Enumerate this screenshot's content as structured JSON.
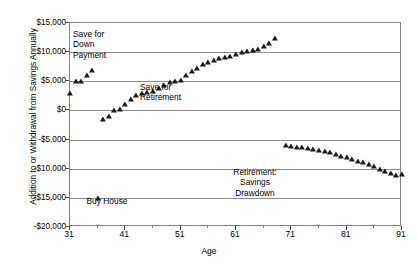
{
  "chart_data": {
    "type": "scatter",
    "title": "",
    "xlabel": "Age",
    "ylabel": "Addition to or Withdrawal from Savings Annually",
    "xlim": [
      31,
      91
    ],
    "ylim": [
      -20000,
      15000
    ],
    "grid": true,
    "legend": "none",
    "y_ticks": [
      15000,
      10000,
      5000,
      0,
      -5000,
      -10000,
      -15000,
      -20000
    ],
    "y_tick_labels": [
      "$15,000",
      "$10,000",
      "$5,000",
      "$0",
      "-$5,000",
      "-$10,000",
      "-$15,000",
      "-$20,000"
    ],
    "x_ticks": [
      31,
      41,
      51,
      61,
      71,
      81,
      91
    ],
    "x_tick_labels": [
      "31",
      "41",
      "51",
      "61",
      "71",
      "81",
      "91"
    ],
    "x_minor_ticks": [
      36,
      46,
      56,
      66,
      76,
      86
    ],
    "series": [
      {
        "name": "Addition to or Withdrawal from Savings Annually",
        "marker": "triangle",
        "color": "#1a1a1a",
        "x": [
          31,
          32,
          33,
          34,
          35,
          36,
          37,
          38,
          39,
          40,
          41,
          42,
          43,
          44,
          45,
          46,
          47,
          48,
          49,
          50,
          51,
          52,
          53,
          54,
          55,
          56,
          57,
          58,
          59,
          60,
          61,
          62,
          63,
          64,
          65,
          66,
          67,
          68,
          70,
          71,
          72,
          73,
          74,
          75,
          76,
          77,
          78,
          79,
          80,
          81,
          82,
          83,
          84,
          85,
          86,
          87,
          88,
          89,
          90,
          91,
          92
        ],
        "y": [
          3000,
          5000,
          5100,
          6100,
          7000,
          -15000,
          -1500,
          -1000,
          0,
          300,
          1100,
          1900,
          2600,
          3000,
          3200,
          3400,
          3800,
          4400,
          4800,
          5100,
          5200,
          6000,
          6700,
          7300,
          8000,
          8300,
          8700,
          9000,
          9200,
          9400,
          9700,
          10000,
          10200,
          10300,
          10500,
          11000,
          11600,
          12400,
          -6000,
          -6100,
          -6200,
          -6300,
          -6400,
          -6600,
          -6800,
          -7000,
          -7200,
          -7500,
          -7800,
          -8000,
          -8300,
          -8600,
          -8900,
          -9200,
          -9600,
          -10000,
          -10400,
          -10800,
          -11100,
          -10900,
          -5200
        ]
      }
    ],
    "annotations": [
      {
        "id": "down-payment",
        "text": "Save for\nDown\nPayment"
      },
      {
        "id": "retirement-save",
        "text": "Save for\nRetirement"
      },
      {
        "id": "drawdown",
        "text": "Retirement:\nSavings\nDrawdown"
      },
      {
        "id": "buy-house",
        "text": "Buy House"
      }
    ]
  }
}
